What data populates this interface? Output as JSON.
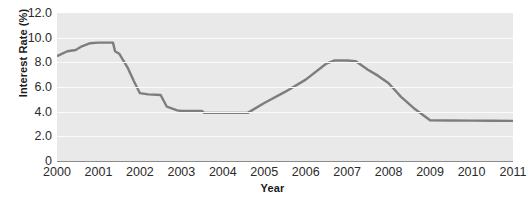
{
  "chart_data": {
    "type": "line",
    "title": "",
    "xlabel": "Year",
    "ylabel": "Interest Rate (%)",
    "xlim": [
      2000,
      2011
    ],
    "ylim": [
      0,
      12
    ],
    "grid": true,
    "legend_position": "none",
    "line_color": "#7d7d7d",
    "plot_background": "#e9e9e9",
    "gridline_color": "#fbfbfb",
    "y_ticks": [
      "12.0",
      "10.0",
      "8.0",
      "6.0",
      "4.0",
      "2.0",
      "0"
    ],
    "y_tick_values": [
      12.0,
      10.0,
      8.0,
      6.0,
      4.0,
      2.0,
      0
    ],
    "x_ticks": [
      "2000",
      "2001",
      "2002",
      "2003",
      "2004",
      "2005",
      "2006",
      "2007",
      "2008",
      "2009",
      "2010",
      "2011"
    ],
    "x_tick_values": [
      2000,
      2001,
      2002,
      2003,
      2004,
      2005,
      2006,
      2007,
      2008,
      2009,
      2010,
      2011
    ],
    "series": [
      {
        "name": "Interest Rate",
        "points": [
          [
            2000.0,
            8.5
          ],
          [
            2000.25,
            8.9
          ],
          [
            2000.45,
            9.0
          ],
          [
            2000.6,
            9.3
          ],
          [
            2000.8,
            9.55
          ],
          [
            2001.0,
            9.6
          ],
          [
            2001.35,
            9.6
          ],
          [
            2001.4,
            8.9
          ],
          [
            2001.5,
            8.7
          ],
          [
            2001.7,
            7.6
          ],
          [
            2001.85,
            6.5
          ],
          [
            2002.0,
            5.5
          ],
          [
            2002.2,
            5.4
          ],
          [
            2002.5,
            5.35
          ],
          [
            2002.65,
            4.4
          ],
          [
            2002.9,
            4.1
          ],
          [
            2003.0,
            4.05
          ],
          [
            2003.5,
            4.05
          ],
          [
            2003.55,
            3.9
          ],
          [
            2004.0,
            3.9
          ],
          [
            2004.6,
            3.9
          ],
          [
            2005.0,
            4.7
          ],
          [
            2005.5,
            5.6
          ],
          [
            2006.0,
            6.6
          ],
          [
            2006.5,
            7.9
          ],
          [
            2006.7,
            8.15
          ],
          [
            2007.0,
            8.15
          ],
          [
            2007.2,
            8.1
          ],
          [
            2007.5,
            7.4
          ],
          [
            2007.75,
            6.9
          ],
          [
            2008.0,
            6.3
          ],
          [
            2008.3,
            5.2
          ],
          [
            2008.6,
            4.3
          ],
          [
            2009.0,
            3.3
          ],
          [
            2009.5,
            3.28
          ],
          [
            2010.0,
            3.27
          ],
          [
            2010.5,
            3.26
          ],
          [
            2011.0,
            3.25
          ]
        ]
      }
    ]
  }
}
